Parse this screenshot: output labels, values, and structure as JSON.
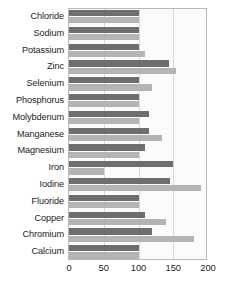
{
  "chart_data": {
    "type": "bar",
    "orientation": "horizontal",
    "title": "",
    "xlabel": "",
    "ylabel": "",
    "xlim": [
      0,
      200
    ],
    "ylim": null,
    "grid": true,
    "gridlines_x": [
      50,
      100,
      150
    ],
    "legend_position": "none",
    "xticks": [
      "0",
      "50",
      "100",
      "150",
      "200"
    ],
    "xtick_values": [
      0,
      50,
      100,
      150,
      200
    ],
    "categories": [
      "Chloride",
      "Sodium",
      "Potassium",
      "Zinc",
      "Selenium",
      "Phosphorus",
      "Molybdenum",
      "Manganese",
      "Magnesium",
      "Iron",
      "Iodine",
      "Fluoride",
      "Copper",
      "Chromium",
      "Calcium"
    ],
    "series": [
      {
        "name": "series-a",
        "color": "#6e6e6e",
        "values": [
          100,
          100,
          100,
          144,
          100,
          100,
          115,
          115,
          110,
          150,
          145,
          100,
          110,
          120,
          100
        ]
      },
      {
        "name": "series-b",
        "color": "#b4b4b4",
        "values": [
          100,
          100,
          110,
          154,
          120,
          100,
          100,
          134,
          100,
          50,
          190,
          100,
          140,
          180,
          100
        ]
      }
    ]
  },
  "colors": {
    "series_a": "#6e6e6e",
    "series_b": "#b4b4b4",
    "grid": "#d8d8d8",
    "frame": "#b9b9b9",
    "plot_background": "#fbfbfb",
    "text": "#1d1d1d"
  }
}
